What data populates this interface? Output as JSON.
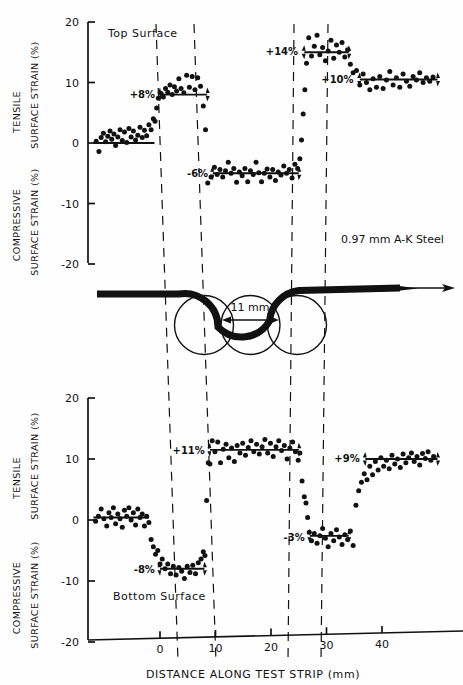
{
  "figure": {
    "note_label": "0.97 mm A-K Steel",
    "gap_label": "11 mm",
    "top_surface_label": "Top Surface",
    "bottom_surface_label": "Bottom Surface",
    "xtitle": "DISTANCE ALONG TEST STRIP (mm)",
    "axis_labels": {
      "tensile": "TENSILE",
      "compressive": "COMPRESSIVE",
      "surface_strain_upper": "SURFACE STRAIN (%)",
      "surface_strain_lower": "SURFACE STRAIN (%)"
    },
    "colors": {
      "ink": "#111111",
      "paper": "#fefefe"
    }
  },
  "chart_data": [
    {
      "type": "scatter",
      "title": "Top Surface",
      "xlabel": "DISTANCE ALONG TEST STRIP (mm)",
      "ylabel": "SURFACE STRAIN (%)",
      "xlim": [
        -12,
        50
      ],
      "ylim": [
        -20,
        20
      ],
      "xticks": [
        0,
        10,
        20,
        30,
        40
      ],
      "yticks": [
        20,
        10,
        0,
        -10,
        -20
      ],
      "grid": false,
      "legend": null,
      "plateaus": [
        {
          "label": "0%",
          "value": 0,
          "x_start": -12,
          "x_end": -1,
          "annotated": false
        },
        {
          "label": "+8%",
          "value": 8,
          "x_start": 0,
          "x_end": 8.5,
          "annotated": true
        },
        {
          "label": "-6%",
          "value": -5,
          "x_start": 9.5,
          "x_end": 25,
          "annotated": true
        },
        {
          "label": "+14%",
          "value": 15,
          "x_start": 26,
          "x_end": 34,
          "annotated": true
        },
        {
          "label": "+10%",
          "value": 10.5,
          "x_start": 36,
          "x_end": 50,
          "annotated": true
        }
      ],
      "points": [
        [
          -11.5,
          0.3
        ],
        [
          -11,
          -1.4
        ],
        [
          -10.6,
          0.9
        ],
        [
          -10.2,
          1.6
        ],
        [
          -9.8,
          0.2
        ],
        [
          -9.4,
          1.1
        ],
        [
          -9.0,
          2.0
        ],
        [
          -8.7,
          0.6
        ],
        [
          -8.3,
          1.5
        ],
        [
          -8.0,
          -0.4
        ],
        [
          -7.6,
          1.0
        ],
        [
          -7.2,
          2.2
        ],
        [
          -6.8,
          0.4
        ],
        [
          -6.4,
          1.8
        ],
        [
          -6.0,
          0.1
        ],
        [
          -5.6,
          2.4
        ],
        [
          -5.2,
          1.0
        ],
        [
          -4.8,
          2.0
        ],
        [
          -4.4,
          0.5
        ],
        [
          -4.0,
          1.3
        ],
        [
          -3.6,
          2.6
        ],
        [
          -3.2,
          0.9
        ],
        [
          -2.8,
          2.1
        ],
        [
          -2.4,
          1.2
        ],
        [
          -2.0,
          3.0
        ],
        [
          -1.6,
          2.2
        ],
        [
          -1.2,
          4.0
        ],
        [
          -0.9,
          3.6
        ],
        [
          -0.6,
          5.8
        ],
        [
          -0.3,
          7.4
        ],
        [
          0.2,
          8.2
        ],
        [
          0.6,
          7.6
        ],
        [
          1.0,
          9.0
        ],
        [
          1.4,
          8.4
        ],
        [
          1.8,
          9.6
        ],
        [
          2.2,
          8.0
        ],
        [
          2.6,
          9.3
        ],
        [
          3.0,
          8.6
        ],
        [
          3.4,
          10.6
        ],
        [
          3.8,
          9.0
        ],
        [
          4.3,
          8.3
        ],
        [
          4.8,
          11.2
        ],
        [
          5.3,
          9.2
        ],
        [
          5.8,
          11.0
        ],
        [
          6.3,
          8.8
        ],
        [
          6.8,
          10.8
        ],
        [
          7.3,
          9.4
        ],
        [
          7.8,
          6.1
        ],
        [
          8.2,
          2.2
        ],
        [
          8.6,
          -6.6
        ],
        [
          9.2,
          -5.6
        ],
        [
          9.8,
          -4.0
        ],
        [
          10.3,
          -5.2
        ],
        [
          10.8,
          -4.4
        ],
        [
          11.3,
          -5.6
        ],
        [
          11.8,
          -4.6
        ],
        [
          12.3,
          -3.2
        ],
        [
          12.8,
          -5.0
        ],
        [
          13.3,
          -4.2
        ],
        [
          13.8,
          -6.5
        ],
        [
          14.3,
          -4.8
        ],
        [
          14.8,
          -5.4
        ],
        [
          15.3,
          -4.2
        ],
        [
          15.8,
          -6.4
        ],
        [
          16.3,
          -4.6
        ],
        [
          16.8,
          -5.2
        ],
        [
          17.3,
          -3.2
        ],
        [
          17.8,
          -4.9
        ],
        [
          18.3,
          -6.4
        ],
        [
          18.8,
          -5.0
        ],
        [
          19.3,
          -4.3
        ],
        [
          19.8,
          -5.6
        ],
        [
          20.3,
          -4.4
        ],
        [
          20.8,
          -6.2
        ],
        [
          21.3,
          -4.8
        ],
        [
          21.8,
          -5.3
        ],
        [
          22.3,
          -3.8
        ],
        [
          22.8,
          -5.0
        ],
        [
          23.3,
          -4.4
        ],
        [
          23.8,
          -5.8
        ],
        [
          24.3,
          -3.5
        ],
        [
          24.8,
          -4.2
        ],
        [
          25.2,
          -2.6
        ],
        [
          25.5,
          0.5
        ],
        [
          25.8,
          4.8
        ],
        [
          26.1,
          8.8
        ],
        [
          26.4,
          13.2
        ],
        [
          26.8,
          17.4
        ],
        [
          27.3,
          14.4
        ],
        [
          27.8,
          16.0
        ],
        [
          28.3,
          17.8
        ],
        [
          28.8,
          14.6
        ],
        [
          29.3,
          15.8
        ],
        [
          29.8,
          13.6
        ],
        [
          30.3,
          15.2
        ],
        [
          30.8,
          17.0
        ],
        [
          31.3,
          14.0
        ],
        [
          31.8,
          16.2
        ],
        [
          32.3,
          15.0
        ],
        [
          32.8,
          16.6
        ],
        [
          33.3,
          14.2
        ],
        [
          33.8,
          15.4
        ],
        [
          34.3,
          13.0
        ],
        [
          34.8,
          11.6
        ],
        [
          35.4,
          12.0
        ],
        [
          36.0,
          9.6
        ],
        [
          36.6,
          11.4
        ],
        [
          37.2,
          10.0
        ],
        [
          37.8,
          8.8
        ],
        [
          38.4,
          10.6
        ],
        [
          39.0,
          9.2
        ],
        [
          39.6,
          11.0
        ],
        [
          40.2,
          9.0
        ],
        [
          40.8,
          10.4
        ],
        [
          41.4,
          11.8
        ],
        [
          42.0,
          9.6
        ],
        [
          42.6,
          10.8
        ],
        [
          43.2,
          9.2
        ],
        [
          43.8,
          11.4
        ],
        [
          44.4,
          10.2
        ],
        [
          45.0,
          9.4
        ],
        [
          45.6,
          11.0
        ],
        [
          46.2,
          10.4
        ],
        [
          46.8,
          11.6
        ],
        [
          47.4,
          10.0
        ],
        [
          48.0,
          10.8
        ],
        [
          48.6,
          10.2
        ],
        [
          49.2,
          10.9
        ]
      ]
    },
    {
      "type": "scatter",
      "title": "Bottom Surface",
      "xlabel": "DISTANCE ALONG TEST STRIP (mm)",
      "ylabel": "SURFACE STRAIN (%)",
      "xlim": [
        -12,
        50
      ],
      "ylim": [
        -20,
        20
      ],
      "xticks": [
        0,
        10,
        20,
        30,
        40
      ],
      "yticks": [
        20,
        10,
        0,
        -10,
        -20
      ],
      "grid": false,
      "legend": null,
      "plateaus": [
        {
          "label": "0%",
          "value": 0.4,
          "x_start": -12,
          "x_end": -2,
          "annotated": false
        },
        {
          "label": "-8%",
          "value": -8,
          "x_start": 0,
          "x_end": 8,
          "annotated": true
        },
        {
          "label": "+11%",
          "value": 11.5,
          "x_start": 9,
          "x_end": 25,
          "annotated": true
        },
        {
          "label": "-3%",
          "value": -2.6,
          "x_start": 27,
          "x_end": 34,
          "annotated": true
        },
        {
          "label": "+9%",
          "value": 10,
          "x_start": 37,
          "x_end": 50,
          "annotated": true
        }
      ],
      "points": [
        [
          -11.6,
          -0.2
        ],
        [
          -11.1,
          0.6
        ],
        [
          -10.6,
          1.8
        ],
        [
          -10.1,
          0.2
        ],
        [
          -9.6,
          -1.0
        ],
        [
          -9.2,
          1.2
        ],
        [
          -8.8,
          0.4
        ],
        [
          -8.4,
          2.0
        ],
        [
          -8.0,
          -0.6
        ],
        [
          -7.6,
          1.0
        ],
        [
          -7.2,
          0.2
        ],
        [
          -6.8,
          -1.2
        ],
        [
          -6.4,
          1.6
        ],
        [
          -6.0,
          0.6
        ],
        [
          -5.6,
          2.0
        ],
        [
          -5.2,
          0.0
        ],
        [
          -4.8,
          1.2
        ],
        [
          -4.4,
          -0.8
        ],
        [
          -4.0,
          1.8
        ],
        [
          -3.6,
          0.4
        ],
        [
          -3.2,
          1.0
        ],
        [
          -2.8,
          -1.0
        ],
        [
          -2.4,
          0.6
        ],
        [
          -2.0,
          -0.4
        ],
        [
          -1.6,
          -3.2
        ],
        [
          -1.2,
          -4.4
        ],
        [
          -0.8,
          -5.6
        ],
        [
          -0.4,
          -5.0
        ],
        [
          0.0,
          -7.2
        ],
        [
          0.4,
          -6.4
        ],
        [
          0.9,
          -8.0
        ],
        [
          1.4,
          -7.2
        ],
        [
          1.9,
          -8.8
        ],
        [
          2.4,
          -7.6
        ],
        [
          2.9,
          -9.0
        ],
        [
          3.4,
          -7.8
        ],
        [
          3.9,
          -8.4
        ],
        [
          4.4,
          -9.6
        ],
        [
          4.9,
          -7.6
        ],
        [
          5.4,
          -8.6
        ],
        [
          5.9,
          -7.4
        ],
        [
          6.4,
          -8.8
        ],
        [
          6.9,
          -7.0
        ],
        [
          7.4,
          -6.4
        ],
        [
          7.8,
          -5.2
        ],
        [
          8.1,
          -5.8
        ],
        [
          8.4,
          3.2
        ],
        [
          8.7,
          9.4
        ],
        [
          9.0,
          9.2
        ],
        [
          9.4,
          13.0
        ],
        [
          9.9,
          11.2
        ],
        [
          10.4,
          12.8
        ],
        [
          10.9,
          9.4
        ],
        [
          11.4,
          11.6
        ],
        [
          11.9,
          12.4
        ],
        [
          12.4,
          10.2
        ],
        [
          12.9,
          11.8
        ],
        [
          13.4,
          9.6
        ],
        [
          13.9,
          12.2
        ],
        [
          14.4,
          11.0
        ],
        [
          14.9,
          12.6
        ],
        [
          15.4,
          10.6
        ],
        [
          15.9,
          11.9
        ],
        [
          16.4,
          13.0
        ],
        [
          16.9,
          11.2
        ],
        [
          17.4,
          12.4
        ],
        [
          17.9,
          10.8
        ],
        [
          18.4,
          12.0
        ],
        [
          18.9,
          13.2
        ],
        [
          19.4,
          11.0
        ],
        [
          19.9,
          12.6
        ],
        [
          20.4,
          10.4
        ],
        [
          20.9,
          12.0
        ],
        [
          21.4,
          13.0
        ],
        [
          21.9,
          11.4
        ],
        [
          22.4,
          12.2
        ],
        [
          22.9,
          10.0
        ],
        [
          23.4,
          11.8
        ],
        [
          23.9,
          12.8
        ],
        [
          24.4,
          11.2
        ],
        [
          24.9,
          9.8
        ],
        [
          25.2,
          11.0
        ],
        [
          25.6,
          6.4
        ],
        [
          26.0,
          3.8
        ],
        [
          26.3,
          2.8
        ],
        [
          26.6,
          0.4
        ],
        [
          26.9,
          -2.0
        ],
        [
          27.3,
          -3.4
        ],
        [
          27.8,
          -2.2
        ],
        [
          28.3,
          -3.8
        ],
        [
          28.8,
          -2.6
        ],
        [
          29.3,
          -1.4
        ],
        [
          29.8,
          -3.0
        ],
        [
          30.3,
          -4.4
        ],
        [
          30.8,
          -2.2
        ],
        [
          31.3,
          -3.4
        ],
        [
          31.8,
          -1.6
        ],
        [
          32.3,
          -2.8
        ],
        [
          32.8,
          -4.0
        ],
        [
          33.3,
          -2.4
        ],
        [
          33.8,
          -3.2
        ],
        [
          34.3,
          -1.8
        ],
        [
          34.8,
          -4.2
        ],
        [
          35.3,
          2.4
        ],
        [
          35.8,
          4.8
        ],
        [
          36.3,
          6.2
        ],
        [
          36.8,
          7.6
        ],
        [
          37.3,
          6.6
        ],
        [
          37.8,
          8.8
        ],
        [
          38.3,
          7.4
        ],
        [
          38.8,
          9.6
        ],
        [
          39.3,
          8.2
        ],
        [
          39.8,
          10.2
        ],
        [
          40.3,
          8.8
        ],
        [
          40.8,
          9.8
        ],
        [
          41.3,
          8.4
        ],
        [
          41.8,
          10.6
        ],
        [
          42.3,
          9.2
        ],
        [
          42.8,
          10.0
        ],
        [
          43.3,
          8.6
        ],
        [
          43.8,
          10.8
        ],
        [
          44.3,
          9.4
        ],
        [
          44.8,
          10.2
        ],
        [
          45.3,
          11.0
        ],
        [
          45.8,
          9.6
        ],
        [
          46.3,
          10.4
        ],
        [
          46.8,
          9.0
        ],
        [
          47.3,
          10.9
        ],
        [
          47.8,
          10.1
        ],
        [
          48.3,
          11.2
        ],
        [
          48.8,
          9.8
        ],
        [
          49.3,
          10.4
        ]
      ]
    }
  ]
}
